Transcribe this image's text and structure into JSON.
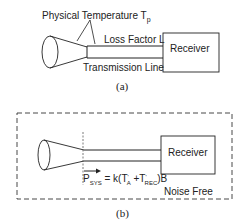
{
  "diagram_a": {
    "physical_temperature_label": "Physical Temperature T",
    "physical_temperature_subscript": "p",
    "loss_factor_label": "Loss Factor L",
    "transmission_line_label": "Transmission Line",
    "receiver_label": "Receiver",
    "caption": "(a)"
  },
  "diagram_b": {
    "receiver_label": "Receiver",
    "noise_free_label": "Noise Free",
    "equation": {
      "p": "P",
      "p_sub": "SYS",
      "eq": " = k(T",
      "ta_sup": "'",
      "ta_sub": "A",
      "plus": " +T",
      "trec_sup": "'",
      "trec_sub": "REC",
      "tail": ")B"
    },
    "caption": "(b)"
  }
}
